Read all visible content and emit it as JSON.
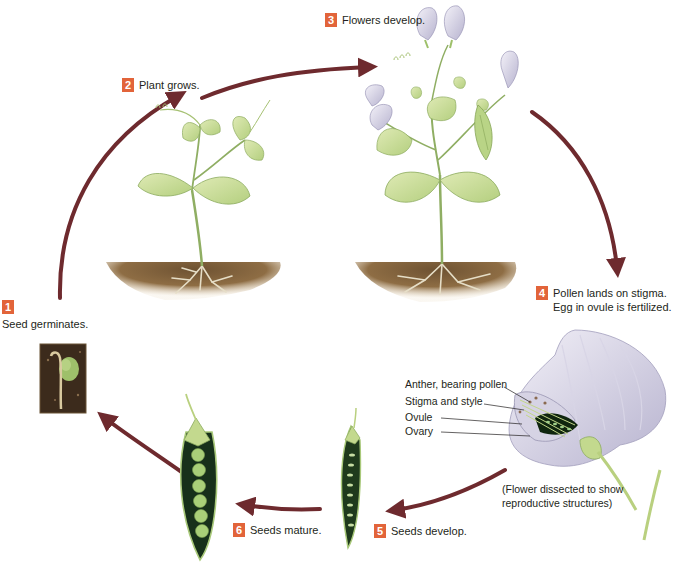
{
  "diagram": {
    "type": "life-cycle",
    "colors": {
      "badge": "#e2643a",
      "arrow": "#6e2a2e",
      "leaf": "#c9dc9a",
      "leaf_vein": "#7fa653",
      "soil": "#8a6a43",
      "root": "#e8e0c8",
      "petal": "#c9c6dc",
      "pod_dark": "#1f3a1c",
      "pea": "#a9cf78"
    },
    "steps": [
      {
        "number": "1",
        "text": "Seed germinates."
      },
      {
        "number": "2",
        "text": "Plant grows."
      },
      {
        "number": "3",
        "text": "Flowers develop."
      },
      {
        "number": "4",
        "text": "Pollen lands on stigma.",
        "text2": "Egg in ovule is fertilized."
      },
      {
        "number": "5",
        "text": "Seeds develop."
      },
      {
        "number": "6",
        "text": "Seeds mature."
      }
    ],
    "flower_labels": [
      "Anther, bearing pollen",
      "Stigma and style",
      "Ovule",
      "Ovary"
    ],
    "flower_caption": {
      "line1": "(Flower dissected to show",
      "line2": "reproductive structures)"
    }
  }
}
